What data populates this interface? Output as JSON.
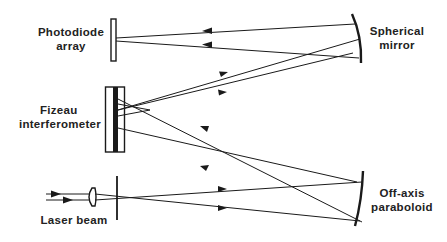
{
  "diagram": {
    "type": "optical-setup",
    "labels": {
      "photodiode_array": [
        "Photodiode",
        "array"
      ],
      "fizeau_interferometer": [
        "Fizeau",
        "interferometer"
      ],
      "laser_beam": [
        "Laser beam"
      ],
      "spherical_mirror": [
        "Spherical",
        "mirror"
      ],
      "off_axis_paraboloid": [
        "Off-axis",
        "paraboloid"
      ]
    },
    "components": [
      {
        "id": "photodiode-array",
        "kind": "detector"
      },
      {
        "id": "fizeau-interferometer",
        "kind": "interferometer"
      },
      {
        "id": "laser-lens",
        "kind": "lens"
      },
      {
        "id": "pinhole-aperture",
        "kind": "aperture"
      },
      {
        "id": "spherical-mirror",
        "kind": "curved-mirror"
      },
      {
        "id": "off-axis-paraboloid",
        "kind": "curved-mirror"
      }
    ],
    "colors": {
      "line": "#1a1a1a",
      "background": "#ffffff"
    }
  }
}
